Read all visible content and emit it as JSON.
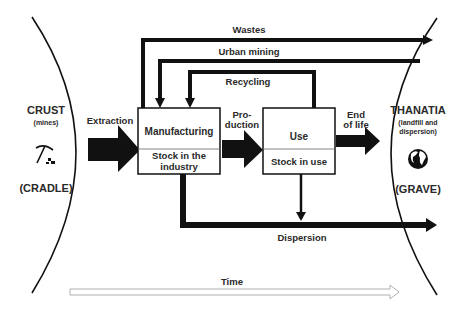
{
  "left_region": {
    "title": "CRUST",
    "subtitle": "(mines)",
    "label": "(CRADLE)",
    "icon": "pickaxe-icon"
  },
  "right_region": {
    "title": "THANATIA",
    "subtitle_line1": "(landfill and",
    "subtitle_line2": "dispersion)",
    "label": "(GRAVE)",
    "icon": "globe-icon"
  },
  "boxes": {
    "manufacturing": {
      "top": "Manufacturing",
      "bottom_line1": "Stock in the",
      "bottom_line2": "industry"
    },
    "use": {
      "top": "Use",
      "bottom": "Stock in use"
    }
  },
  "flows": {
    "extraction": "Extraction",
    "production_line1": "Pro-",
    "production_line2": "duction",
    "end_of_life_line1": "End",
    "end_of_life_line2": "of life",
    "wastes": "Wastes",
    "urban_mining": "Urban mining",
    "recycling": "Recycling",
    "dispersion": "Dispersion"
  },
  "timeline": {
    "label": "Time"
  },
  "colors": {
    "stroke": "#111111",
    "text": "#2a2a2a",
    "time_arrow": "#b0b0b0"
  }
}
